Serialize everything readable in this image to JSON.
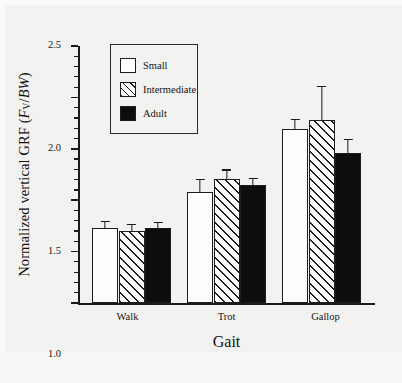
{
  "chart_data": {
    "type": "bar",
    "title": "",
    "xlabel": "Gait",
    "ylabel": "Normalized vertical GRF (Fv/BW)",
    "ylabel_parts": {
      "prefix": "Normalized vertical GRF (",
      "italic_f": "F",
      "subscript": "V",
      "slash": "/",
      "italic_bw": "BW",
      "suffix": ")"
    },
    "categories": [
      "Walk",
      "Trot",
      "Gallop"
    ],
    "ylim": [
      0,
      2.5
    ],
    "ytick_labels": [
      "0",
      "0.5",
      "1.0",
      "1.5",
      "2.0",
      "2.5"
    ],
    "ytick_values": [
      0,
      0.5,
      1.0,
      1.5,
      2.0,
      2.5
    ],
    "yminor_step": 0.1,
    "grid": false,
    "legend_position": "upper-left-inside",
    "series": [
      {
        "name": "Small",
        "fill": "open",
        "values": [
          0.73,
          1.08,
          1.69
        ],
        "errors": [
          0.07,
          0.13,
          0.1
        ]
      },
      {
        "name": "Intermediate",
        "fill": "hatched",
        "values": [
          0.7,
          1.21,
          1.78
        ],
        "errors": [
          0.07,
          0.09,
          0.33
        ]
      },
      {
        "name": "Adult",
        "fill": "solid-black",
        "values": [
          0.73,
          1.15,
          1.46
        ],
        "errors": [
          0.06,
          0.07,
          0.14
        ]
      }
    ]
  },
  "legend": {
    "items": [
      {
        "label": "Small",
        "style": "small"
      },
      {
        "label": "Intermediate",
        "style": "intermediate"
      },
      {
        "label": "Adult",
        "style": "adult"
      }
    ]
  },
  "colors": {
    "axis": "#1a1a1a",
    "bar_outline": "#1d1d1d",
    "adult_fill": "#0d0d0d",
    "small_fill": "#fdfdfc",
    "background": "#f2f2f0"
  },
  "caption": ""
}
